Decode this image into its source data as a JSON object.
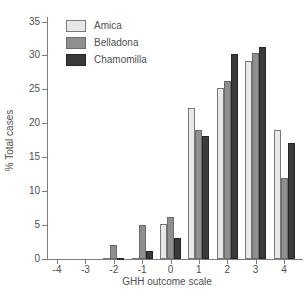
{
  "chart_data": {
    "type": "bar",
    "title": "",
    "xlabel": "GHH outcome scale",
    "ylabel": "% Total cases",
    "categories": [
      "-4",
      "-3",
      "-2",
      "-1",
      "0",
      "1",
      "2",
      "3",
      "4"
    ],
    "series": [
      {
        "name": "Amica",
        "color": "#e8e8e8",
        "border": "#7a7a7a",
        "values": [
          0,
          0,
          0.2,
          0.2,
          5.1,
          22.2,
          25.2,
          29.2,
          19.0
        ]
      },
      {
        "name": "Belladona",
        "color": "#8f8f8f",
        "border": "#6a6a6a",
        "values": [
          0,
          0,
          2.0,
          5.0,
          6.2,
          19.0,
          26.3,
          30.3,
          12.0
        ]
      },
      {
        "name": "Chamomilla",
        "color": "#3a3a3a",
        "border": "#262626",
        "values": [
          0,
          0,
          0.2,
          1.2,
          3.1,
          18.1,
          30.2,
          31.2,
          17.1
        ]
      }
    ],
    "ylim": [
      0,
      35
    ],
    "yticks": [
      0,
      5,
      10,
      15,
      20,
      25,
      30,
      35
    ],
    "legend_position": "top-left",
    "grid": false
  },
  "colors": {
    "axis": "#7d7d7d",
    "text": "#4f4f4f",
    "background": "#ffffff"
  }
}
